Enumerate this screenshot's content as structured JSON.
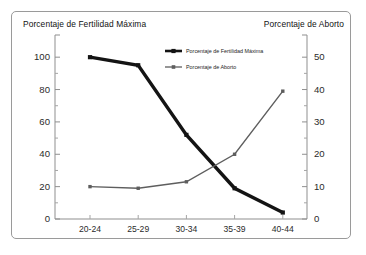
{
  "chart_data": {
    "type": "line",
    "title": "",
    "left_axis_title": "Porcentaje de Fertilidad Máxima",
    "right_axis_title": "Porcentaje de Aborto",
    "xlabel": "",
    "categories": [
      "20-24",
      "25-29",
      "30-34",
      "35-39",
      "40-44"
    ],
    "series": [
      {
        "name": "Porcentaje de Fertilidad Máxima",
        "axis": "left",
        "color": "#141414",
        "marker": "square",
        "values": [
          100,
          95,
          52,
          19,
          4
        ]
      },
      {
        "name": "Porcentaje de Aborto",
        "axis": "right",
        "color": "#5e5e5e",
        "marker": "square",
        "values": [
          10,
          9.5,
          11.5,
          20,
          39.5
        ]
      }
    ],
    "left_ylim": [
      0,
      110
    ],
    "right_ylim": [
      0,
      55
    ],
    "left_ticks": [
      "0",
      "20",
      "40",
      "60",
      "80",
      "100"
    ],
    "right_ticks": [
      "0",
      "10",
      "20",
      "30",
      "40",
      "50"
    ],
    "grid": false,
    "legend_position": "top-center-right"
  },
  "legend": {
    "entries": [
      {
        "label": "Porcentaje de Fertilidad Máxima"
      },
      {
        "label": "Porcentaje de Aborto"
      }
    ]
  }
}
